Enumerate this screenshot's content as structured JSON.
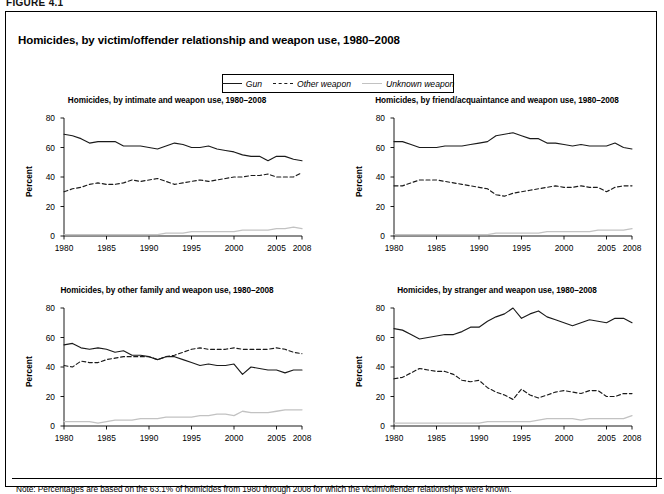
{
  "figure_label": "FIGURE 4.1",
  "title": "Homicides, by victim/offender relationship and weapon use, 1980–2008",
  "note": "Note: Percentages are based on the 63.1% of homicides from 1980 through 2008 for which the victim/offender relationships were known.",
  "legend": {
    "items": [
      {
        "label": "Gun",
        "style": "solid",
        "color": "#1a1a1a"
      },
      {
        "label": "Other weapon",
        "style": "dashed",
        "color": "#1a1a1a"
      },
      {
        "label": "Unknown weapon",
        "style": "solid",
        "color": "#c2c2c2"
      }
    ]
  },
  "axes": {
    "ylabel": "Percent",
    "yticks": [
      0,
      20,
      40,
      60,
      80
    ],
    "ylim": [
      0,
      80
    ],
    "xticks": [
      1980,
      1985,
      1990,
      1995,
      2000,
      2005,
      2008
    ],
    "xlim": [
      1980,
      2008
    ],
    "grid": false
  },
  "chart_data": [
    {
      "type": "line",
      "title": "Homicides, by intimate and weapon use, 1980–2008",
      "xlabel": "",
      "ylabel": "Percent",
      "ylim": [
        0,
        80
      ],
      "xlim": [
        1980,
        2008
      ],
      "grid": false,
      "legend_position": "top-center-shared",
      "x": [
        1980,
        1981,
        1982,
        1983,
        1984,
        1985,
        1986,
        1987,
        1988,
        1989,
        1990,
        1991,
        1992,
        1993,
        1994,
        1995,
        1996,
        1997,
        1998,
        1999,
        2000,
        2001,
        2002,
        2003,
        2004,
        2005,
        2006,
        2007,
        2008
      ],
      "series": [
        {
          "name": "Gun",
          "values": [
            69,
            68,
            66,
            63,
            64,
            64,
            64,
            61,
            61,
            61,
            60,
            59,
            61,
            63,
            62,
            60,
            60,
            61,
            59,
            58,
            57,
            55,
            54,
            54,
            51,
            54,
            54,
            52,
            51
          ]
        },
        {
          "name": "Other weapon",
          "values": [
            30,
            32,
            33,
            35,
            36,
            35,
            35,
            36,
            38,
            37,
            38,
            39,
            37,
            35,
            36,
            37,
            38,
            37,
            38,
            39,
            40,
            40,
            41,
            41,
            42,
            40,
            40,
            40,
            43
          ]
        },
        {
          "name": "Unknown weapon",
          "values": [
            1,
            1,
            1,
            1,
            1,
            1,
            1,
            1,
            1,
            1,
            1,
            1,
            2,
            2,
            2,
            3,
            3,
            3,
            3,
            3,
            3,
            4,
            4,
            4,
            4,
            5,
            5,
            6,
            5
          ]
        }
      ]
    },
    {
      "type": "line",
      "title": "Homicides, by friend/acquaintance and weapon use, 1980–2008",
      "xlabel": "",
      "ylabel": "Percent",
      "ylim": [
        0,
        80
      ],
      "xlim": [
        1980,
        2008
      ],
      "grid": false,
      "legend_position": "top-center-shared",
      "x": [
        1980,
        1981,
        1982,
        1983,
        1984,
        1985,
        1986,
        1987,
        1988,
        1989,
        1990,
        1991,
        1992,
        1993,
        1994,
        1995,
        1996,
        1997,
        1998,
        1999,
        2000,
        2001,
        2002,
        2003,
        2004,
        2005,
        2006,
        2007,
        2008
      ],
      "series": [
        {
          "name": "Gun",
          "values": [
            64,
            64,
            62,
            60,
            60,
            60,
            61,
            61,
            61,
            62,
            63,
            64,
            68,
            69,
            70,
            68,
            66,
            66,
            63,
            63,
            62,
            61,
            62,
            61,
            61,
            61,
            63,
            60,
            59
          ]
        },
        {
          "name": "Other weapon",
          "values": [
            34,
            34,
            36,
            38,
            38,
            38,
            37,
            36,
            35,
            34,
            33,
            32,
            28,
            27,
            29,
            30,
            31,
            32,
            33,
            34,
            33,
            33,
            34,
            33,
            33,
            30,
            33,
            34,
            34
          ]
        },
        {
          "name": "Unknown weapon",
          "values": [
            1,
            1,
            1,
            1,
            1,
            1,
            1,
            1,
            1,
            1,
            1,
            1,
            2,
            2,
            2,
            2,
            2,
            2,
            3,
            3,
            3,
            3,
            3,
            3,
            4,
            4,
            4,
            4,
            5
          ]
        }
      ]
    },
    {
      "type": "line",
      "title": "Homicides, by other family and weapon use, 1980–2008",
      "xlabel": "",
      "ylabel": "Percent",
      "ylim": [
        0,
        80
      ],
      "xlim": [
        1980,
        2008
      ],
      "grid": false,
      "legend_position": "top-center-shared",
      "x": [
        1980,
        1981,
        1982,
        1983,
        1984,
        1985,
        1986,
        1987,
        1988,
        1989,
        1990,
        1991,
        1992,
        1993,
        1994,
        1995,
        1996,
        1997,
        1998,
        1999,
        2000,
        2001,
        2002,
        2003,
        2004,
        2005,
        2006,
        2007,
        2008
      ],
      "series": [
        {
          "name": "Gun",
          "values": [
            55,
            56,
            53,
            52,
            53,
            52,
            50,
            51,
            48,
            48,
            47,
            45,
            47,
            47,
            45,
            43,
            41,
            42,
            41,
            41,
            42,
            35,
            40,
            39,
            38,
            38,
            36,
            38,
            38
          ]
        },
        {
          "name": "Other weapon",
          "values": [
            41,
            40,
            44,
            43,
            43,
            45,
            46,
            47,
            47,
            47,
            47,
            45,
            47,
            48,
            50,
            52,
            53,
            52,
            52,
            52,
            53,
            52,
            52,
            52,
            52,
            53,
            52,
            50,
            49
          ]
        },
        {
          "name": "Unknown weapon",
          "values": [
            3,
            3,
            3,
            3,
            2,
            3,
            4,
            4,
            4,
            5,
            5,
            5,
            6,
            6,
            6,
            6,
            7,
            7,
            8,
            8,
            7,
            10,
            9,
            9,
            9,
            10,
            11,
            11,
            11
          ]
        }
      ]
    },
    {
      "type": "line",
      "title": "Homicides, by stranger and weapon use, 1980–2008",
      "xlabel": "",
      "ylabel": "Percent",
      "ylim": [
        0,
        80
      ],
      "xlim": [
        1980,
        2008
      ],
      "grid": false,
      "legend_position": "top-center-shared",
      "x": [
        1980,
        1981,
        1982,
        1983,
        1984,
        1985,
        1986,
        1987,
        1988,
        1989,
        1990,
        1991,
        1992,
        1993,
        1994,
        1995,
        1996,
        1997,
        1998,
        1999,
        2000,
        2001,
        2002,
        2003,
        2004,
        2005,
        2006,
        2007,
        2008
      ],
      "series": [
        {
          "name": "Gun",
          "values": [
            66,
            65,
            62,
            59,
            60,
            61,
            62,
            62,
            64,
            67,
            67,
            71,
            74,
            76,
            80,
            73,
            76,
            78,
            74,
            72,
            70,
            68,
            70,
            72,
            71,
            70,
            73,
            73,
            70
          ]
        },
        {
          "name": "Other weapon",
          "values": [
            32,
            33,
            36,
            39,
            38,
            37,
            37,
            35,
            31,
            30,
            31,
            26,
            23,
            21,
            18,
            25,
            21,
            19,
            21,
            23,
            24,
            23,
            22,
            24,
            24,
            20,
            20,
            22,
            22
          ]
        },
        {
          "name": "Unknown weapon",
          "values": [
            2,
            2,
            2,
            2,
            2,
            2,
            2,
            2,
            2,
            2,
            2,
            3,
            3,
            3,
            3,
            3,
            3,
            4,
            5,
            5,
            5,
            5,
            4,
            5,
            5,
            5,
            5,
            5,
            7
          ]
        }
      ]
    }
  ]
}
